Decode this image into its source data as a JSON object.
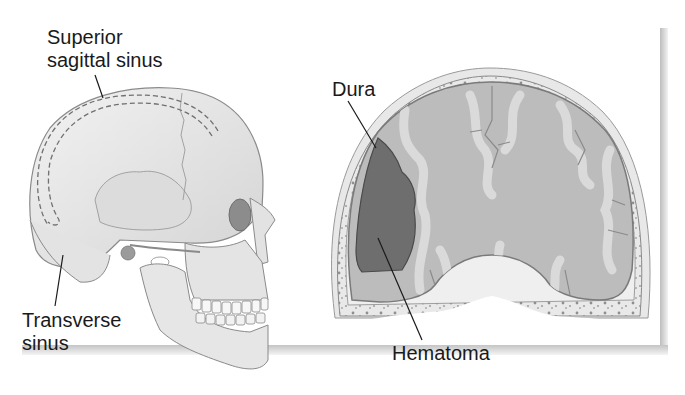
{
  "figure": {
    "left_panel": {
      "subject": "Skull, lateral view with dural venous sinuses",
      "labels": {
        "superior_sagittal_line1": "Superior",
        "superior_sagittal_line2": "sagittal sinus",
        "transverse_line1": "Transverse",
        "transverse_line2": "sinus"
      }
    },
    "right_panel": {
      "subject": "Coronal section of head showing hematoma",
      "labels": {
        "dura": "Dura",
        "hematoma": "Hematoma"
      }
    },
    "colors": {
      "background": "#ffffff",
      "bone": "#e6e6e6",
      "bone_outline": "#8a8a8a",
      "brain_gray": "#bdbdbd",
      "brain_white": "#d9d9d9",
      "hematoma": "#6e6e6e",
      "label_text": "#1a1a1a",
      "shadow": "#c4c4c4"
    }
  }
}
